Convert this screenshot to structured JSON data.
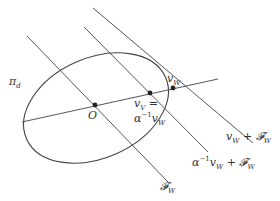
{
  "diagram": {
    "colors": {
      "stroke": "#444444",
      "point": "#222222",
      "text": "#333333"
    },
    "labels": {
      "pi_d": "π",
      "pi_d_sub": "d",
      "origin": "O",
      "vW": "v",
      "vW_sub": "W",
      "vV_eq": "v",
      "vV_eq_sub": "V",
      "vV_eq_sign": " =",
      "alpha_inv": "α",
      "alpha_inv_sup": "−1",
      "alpha_inv_v": "v",
      "alpha_inv_v_sub": "W",
      "line_vW_plus_F": "v",
      "line_vW_plus_F_sub": "W",
      "line_vW_plus_F_rest": " + 𝓕",
      "line_vW_plus_F_rest_sub": "W",
      "line_alpha_plus_F_a": "α",
      "line_alpha_plus_F_sup": "−1",
      "line_alpha_plus_F_v": "v",
      "line_alpha_plus_F_v_sub": "W",
      "line_alpha_plus_F_rest": " + 𝓕",
      "line_alpha_plus_F_rest_sub": "W",
      "line_F": "𝓕",
      "line_F_sub": "W"
    }
  }
}
